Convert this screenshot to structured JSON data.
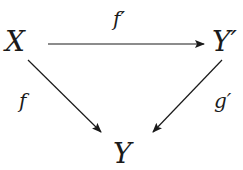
{
  "diagram": {
    "type": "commutative-triangle",
    "nodes": {
      "top_left": "X",
      "top_right": "Y′",
      "bottom": "Y"
    },
    "arrows": {
      "top": "f′",
      "left": "f",
      "right": "g′"
    },
    "colors": {
      "stroke": "#1a1a1a",
      "background": "#ffffff"
    }
  }
}
